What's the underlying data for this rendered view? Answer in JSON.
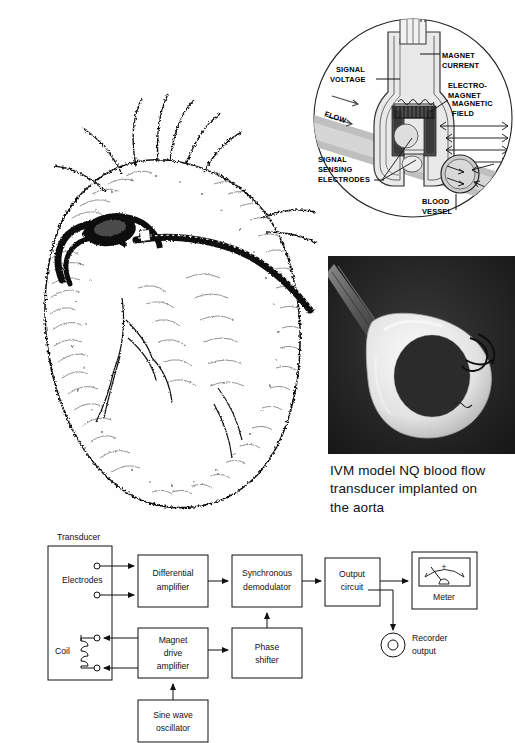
{
  "figure": {
    "heart_illustration": {
      "name": "anatomical heart with implanted flow probe and lead cable",
      "style": "pen-and-ink stipple drawing"
    },
    "cutaway_diagram": {
      "title": "electromagnetic blood flow transducer cutaway",
      "labels": {
        "signal_voltage": "SIGNAL\nVOLTAGE",
        "signal_voltage_l1": "SIGNAL",
        "signal_voltage_l2": "VOLTAGE",
        "magnet_current_l1": "MAGNET",
        "magnet_current_l2": "CURRENT",
        "electromagnet_l1": "ELECTRO-",
        "electromagnet_l2": "MAGNET",
        "magnetic_field_l1": "MAGNETIC",
        "magnetic_field_l2": "FIELD",
        "signal_sensing_electrodes_l1": "SIGNAL",
        "signal_sensing_electrodes_l2": "SENSING",
        "signal_sensing_electrodes_l3": "ELECTRODES",
        "blood_vessel_l1": "BLOOD",
        "blood_vessel_l2": "VESSEL",
        "flow": "FLOW"
      },
      "colors": {
        "vessel_gray": "#b9b9b9",
        "magnet_dark": "#4a4a4a",
        "body_fill": "#e8e8e8",
        "outline": "#1a1a1a"
      }
    },
    "photograph": {
      "alt": "white circular blood flow transducer cuff with lead cable on dark background",
      "caption_l1": "IVM model NQ blood flow",
      "caption_l2": "transducer implanted on",
      "caption_l3": "the aorta"
    }
  },
  "block_diagram": {
    "transducer_label": "Transducer",
    "electrodes_label": "Electrodes",
    "coil_label": "Coil",
    "boxes": [
      {
        "id": "differential-amplifier",
        "line1": "Differential",
        "line2": "amplifier"
      },
      {
        "id": "synchronous-demodulator",
        "line1": "Synchronous",
        "line2": "demodulator"
      },
      {
        "id": "output-circuit",
        "line1": "Output",
        "line2": "circuit"
      },
      {
        "id": "magnet-drive-amplifier",
        "line1": "Magnet",
        "line2": "drive",
        "line3": "amplifier"
      },
      {
        "id": "phase-shifter",
        "line1": "Phase",
        "line2": "shifter"
      },
      {
        "id": "sine-wave-oscillator",
        "line1": "Sine wave",
        "line2": "oscillator"
      }
    ],
    "meter_label": "Meter",
    "meter_plus": "+",
    "recorder_output_l1": "Recorder",
    "recorder_output_l2": "output"
  }
}
